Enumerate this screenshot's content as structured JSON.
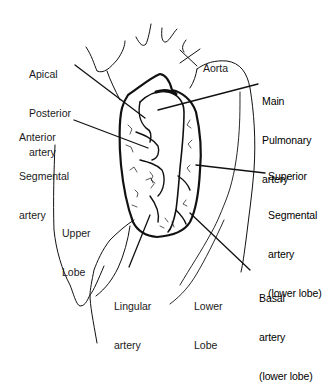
{
  "diagram": {
    "type": "anatomical-illustration",
    "background_color": "#ffffff",
    "line_color": "#111111",
    "labels": {
      "aorta": {
        "lines": [
          "Aorta"
        ]
      },
      "apical_posterior": {
        "lines": [
          "Apical",
          "Posterior",
          "artery"
        ]
      },
      "main_pulmonary": {
        "lines": [
          "Main",
          "Pulmonary",
          "artery"
        ]
      },
      "anterior_segmental": {
        "lines": [
          "Anterior",
          "Segmental",
          "artery"
        ]
      },
      "superior_segmental": {
        "lines": [
          "Superior",
          "Segmental",
          "artery",
          "(lower lobe)"
        ]
      },
      "upper_lobe": {
        "lines": [
          "Upper",
          "Lobe"
        ]
      },
      "lingular": {
        "lines": [
          "Lingular",
          "artery"
        ]
      },
      "lower_lobe": {
        "lines": [
          "Lower",
          "Lobe"
        ]
      },
      "basal": {
        "lines": [
          "Basal",
          "artery",
          "(lower lobe)"
        ]
      }
    }
  }
}
